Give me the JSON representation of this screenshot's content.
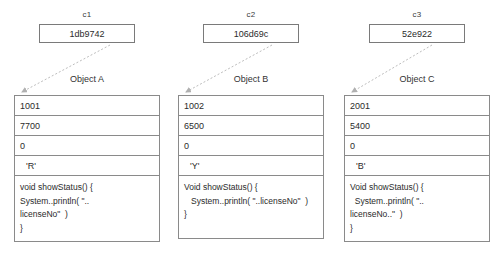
{
  "diagram": {
    "type": "object-reference-diagram",
    "colors": {
      "border": "#8a8a8a",
      "text": "#2b2b2b",
      "arrow": "#b9b9b9",
      "background": "#ffffff"
    },
    "columns": [
      {
        "ref_label": "c1",
        "ref_value": "1db9742",
        "object_title": "Object A",
        "fields": [
          "1001",
          "7700",
          "0",
          "'R'"
        ],
        "code_lines": [
          "void showStatus() {",
          "System..println( \"..",
          "licenseNo\"  )",
          "}"
        ]
      },
      {
        "ref_label": "c2",
        "ref_value": "106d69c",
        "object_title": "Object B",
        "fields": [
          "1002",
          "6500",
          "0",
          "'Y'"
        ],
        "code_lines": [
          "Void showStatus() {",
          "   System..println( \"..licenseNo\"  )",
          "}"
        ]
      },
      {
        "ref_label": "c3",
        "ref_value": "52e922",
        "object_title": "Object C",
        "fields": [
          "2001",
          "5400",
          "0",
          "'B'"
        ],
        "code_lines": [
          "Void showStatus() {",
          "  System..println( \"..",
          "licenseNo..\"  )",
          "}"
        ]
      }
    ]
  }
}
